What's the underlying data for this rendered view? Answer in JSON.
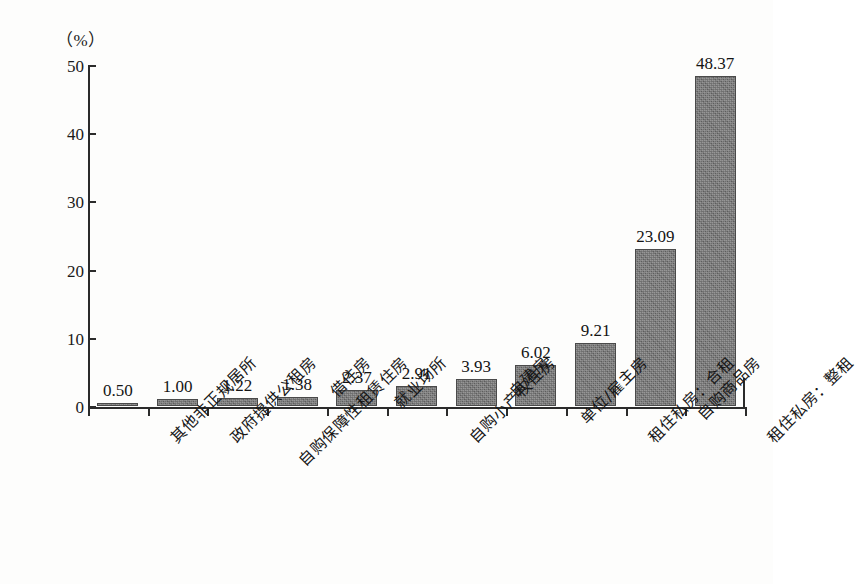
{
  "chart": {
    "unit_label": "（%）",
    "y_axis": {
      "ticks": [
        "0",
        "10",
        "20",
        "30",
        "40",
        "50"
      ]
    }
  },
  "chart_data": {
    "type": "bar",
    "title": "",
    "xlabel": "",
    "ylabel": "（%）",
    "ylim": [
      0,
      50
    ],
    "yticks": [
      0,
      10,
      20,
      30,
      40,
      50
    ],
    "grid": false,
    "legend": "none",
    "categories": [
      "其他非正规居所",
      "政府提供公租房",
      "自购保障性租赁住房",
      "借住房",
      "就业场所",
      "自购小产权住房",
      "自建房",
      "单位/雇主房",
      "租住私房：合租",
      "自购商品房",
      "租住私房：整租"
    ],
    "values": [
      0.5,
      1.0,
      1.22,
      1.38,
      2.37,
      2.91,
      3.93,
      6.02,
      9.21,
      23.09,
      48.37
    ],
    "value_labels": [
      "0.50",
      "1.00",
      "1.22",
      "1.38",
      "2.37",
      "2.91",
      "3.93",
      "6.02",
      "9.21",
      "23.09",
      "48.37"
    ]
  }
}
